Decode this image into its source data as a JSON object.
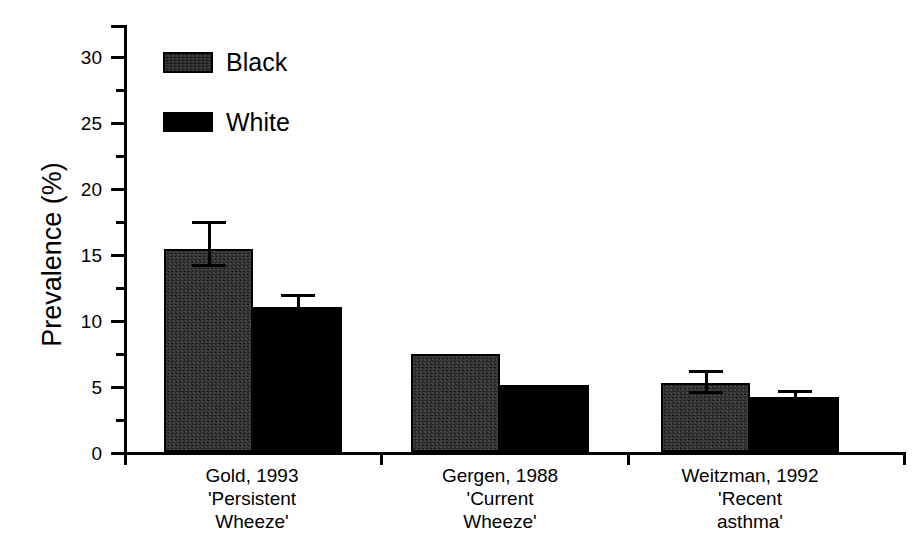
{
  "chart_data": {
    "type": "bar",
    "title": "",
    "xlabel": "",
    "ylabel": "Prevalence (%)",
    "ylim": [
      0,
      33
    ],
    "ytick_labels": [
      "0",
      "5",
      "10",
      "15",
      "20",
      "25",
      "30"
    ],
    "ytick_values": [
      0,
      5,
      10,
      15,
      20,
      25,
      30
    ],
    "yminor_values": [
      2.5,
      7.5,
      12.5,
      17.5,
      22.5,
      27.5
    ],
    "grid": false,
    "legend_position": "upper-left",
    "categories": [
      "Gold, 1993\n'Persistent\nWheeze'",
      "Gergen, 1988\n'Current\nWheeze'",
      "Weitzman, 1992\n'Recent\nasthma'"
    ],
    "series": [
      {
        "name": "Black",
        "fill": "stippled-dark",
        "values": [
          15.4,
          7.4,
          5.2
        ],
        "errors": [
          2.1,
          null,
          1.0
        ]
      },
      {
        "name": "White",
        "fill": "solid-black",
        "values": [
          11.0,
          5.1,
          4.2
        ],
        "errors": [
          1.0,
          null,
          0.5
        ]
      }
    ]
  },
  "legend": {
    "items": [
      {
        "label": "Black",
        "swatch": "stippled-dark"
      },
      {
        "label": "White",
        "swatch": "solid-black"
      }
    ]
  },
  "axis": {
    "y_title": "Prevalence (%)",
    "y_ticks": [
      "30",
      "25",
      "20",
      "15",
      "10",
      "5",
      "0"
    ]
  },
  "colors": {
    "ink": "#000000",
    "background": "#ffffff",
    "series_black_fill": "#1c1c1c",
    "series_white_fill": "#000000"
  }
}
